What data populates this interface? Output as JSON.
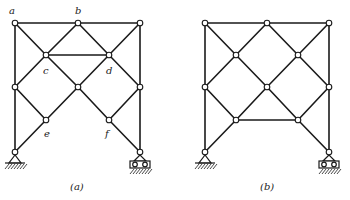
{
  "figures": [
    {
      "id": "a",
      "caption": "(a)",
      "caption_pos": [
        70,
        182
      ],
      "nodes": {
        "a": [
          15,
          23
        ],
        "b": [
          78,
          23
        ],
        "tr": [
          140,
          23
        ],
        "c": [
          46,
          55
        ],
        "d": [
          109,
          55
        ],
        "ml": [
          15,
          87
        ],
        "mm": [
          78,
          87
        ],
        "mr": [
          140,
          87
        ],
        "e": [
          46,
          120
        ],
        "f": [
          109,
          120
        ],
        "bl": [
          15,
          152
        ],
        "br": [
          140,
          152
        ]
      },
      "members": [
        [
          "a",
          "b"
        ],
        [
          "b",
          "tr"
        ],
        [
          "a",
          "ml"
        ],
        [
          "ml",
          "bl"
        ],
        [
          "tr",
          "mr"
        ],
        [
          "mr",
          "br"
        ],
        [
          "a",
          "c"
        ],
        [
          "b",
          "c"
        ],
        [
          "b",
          "d"
        ],
        [
          "tr",
          "d"
        ],
        [
          "c",
          "d"
        ],
        [
          "c",
          "ml"
        ],
        [
          "c",
          "mm"
        ],
        [
          "d",
          "mm"
        ],
        [
          "d",
          "mr"
        ],
        [
          "ml",
          "e"
        ],
        [
          "mm",
          "e"
        ],
        [
          "mm",
          "f"
        ],
        [
          "mr",
          "f"
        ],
        [
          "e",
          "bl"
        ],
        [
          "f",
          "br"
        ]
      ],
      "labels": [
        {
          "text": "a",
          "x": 9,
          "y": 6
        },
        {
          "text": "b",
          "x": 75,
          "y": 6
        },
        {
          "text": "c",
          "x": 43,
          "y": 66
        },
        {
          "text": "d",
          "x": 106,
          "y": 66
        },
        {
          "text": "e",
          "x": 44,
          "y": 129
        },
        {
          "text": "f",
          "x": 105,
          "y": 129
        }
      ],
      "supports": {
        "left": "pin",
        "right": "roller"
      }
    },
    {
      "id": "b",
      "caption": "(b)",
      "caption_pos": [
        260,
        182
      ],
      "nodes": {
        "tl": [
          205,
          23
        ],
        "tm": [
          267,
          23
        ],
        "tr": [
          329,
          23
        ],
        "c": [
          236,
          55
        ],
        "d": [
          298,
          55
        ],
        "ml": [
          205,
          87
        ],
        "mm": [
          267,
          87
        ],
        "mr": [
          329,
          87
        ],
        "e": [
          236,
          120
        ],
        "f": [
          298,
          120
        ],
        "bl": [
          205,
          152
        ],
        "br": [
          329,
          152
        ]
      },
      "members": [
        [
          "tl",
          "tm"
        ],
        [
          "tm",
          "tr"
        ],
        [
          "tl",
          "ml"
        ],
        [
          "ml",
          "bl"
        ],
        [
          "tr",
          "mr"
        ],
        [
          "mr",
          "br"
        ],
        [
          "tl",
          "c"
        ],
        [
          "tm",
          "c"
        ],
        [
          "tm",
          "d"
        ],
        [
          "tr",
          "d"
        ],
        [
          "c",
          "ml"
        ],
        [
          "c",
          "mm"
        ],
        [
          "d",
          "mm"
        ],
        [
          "d",
          "mr"
        ],
        [
          "ml",
          "e"
        ],
        [
          "mm",
          "e"
        ],
        [
          "mm",
          "f"
        ],
        [
          "mr",
          "f"
        ],
        [
          "e",
          "f"
        ],
        [
          "e",
          "bl"
        ],
        [
          "f",
          "br"
        ]
      ],
      "labels": [],
      "supports": {
        "left": "pin",
        "right": "roller"
      }
    }
  ],
  "captions": {
    "a": "(a)",
    "b": "(b)"
  },
  "colors": {
    "line": "#1a1a1a",
    "background": "#ffffff"
  }
}
